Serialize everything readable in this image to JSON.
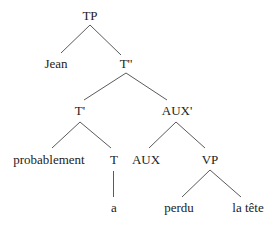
{
  "diagram": {
    "type": "syntax-tree",
    "nodes": {
      "tp": {
        "label": "TP"
      },
      "jean": {
        "label": "Jean"
      },
      "t_bar_bar": {
        "label": "T''"
      },
      "t_bar": {
        "label": "T'"
      },
      "aux_bar": {
        "label": "AUX'"
      },
      "probablement": {
        "label": "probablement"
      },
      "t": {
        "label": "T"
      },
      "aux": {
        "label": "AUX"
      },
      "vp": {
        "label": "VP"
      },
      "a": {
        "label": "a"
      },
      "perdu": {
        "label": "perdu"
      },
      "la_tete": {
        "label": "la tête"
      }
    },
    "edges": [
      [
        "TP",
        "Jean"
      ],
      [
        "TP",
        "T''"
      ],
      [
        "T''",
        "T'"
      ],
      [
        "T''",
        "AUX'"
      ],
      [
        "T'",
        "probablement"
      ],
      [
        "T'",
        "T"
      ],
      [
        "AUX'",
        "AUX"
      ],
      [
        "AUX'",
        "VP"
      ],
      [
        "T",
        "a"
      ],
      [
        "VP",
        "perdu"
      ],
      [
        "VP",
        "la tête"
      ]
    ],
    "colors": {
      "line": "#5a5a5a",
      "text": "#222222",
      "background": "#ffffff"
    }
  }
}
